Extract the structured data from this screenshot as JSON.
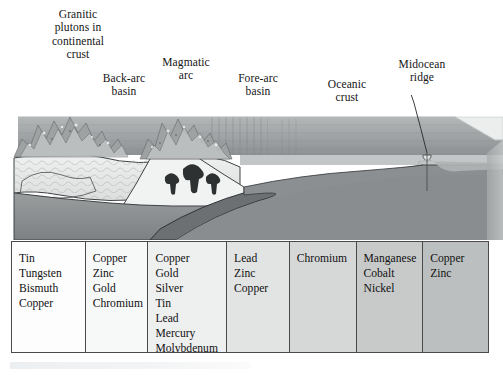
{
  "figure": {
    "type": "geologic-block-diagram"
  },
  "labels": [
    {
      "name": "granitic-plutons",
      "lines": [
        "Granitic",
        "plutons in",
        "continental",
        "crust"
      ]
    },
    {
      "name": "back-arc-basin",
      "lines": [
        "Back-arc",
        "basin"
      ]
    },
    {
      "name": "magmatic-arc",
      "lines": [
        "Magmatic",
        "arc"
      ]
    },
    {
      "name": "fore-arc-basin",
      "lines": [
        "Fore-arc",
        "basin"
      ]
    },
    {
      "name": "oceanic-crust",
      "lines": [
        "Oceanic",
        "crust"
      ]
    },
    {
      "name": "midocean-ridge",
      "lines": [
        "Midocean",
        "ridge"
      ]
    }
  ],
  "table": {
    "columns": [
      {
        "setting": "granitic-plutons",
        "shade": "#fdfdfd",
        "minerals": [
          "Tin",
          "Tungsten",
          "Bismuth",
          "Copper"
        ]
      },
      {
        "setting": "back-arc-basin",
        "shade": "#f7f8f8",
        "minerals": [
          "Copper",
          "Zinc",
          "Gold",
          "Chromium"
        ]
      },
      {
        "setting": "magmatic-arc",
        "shade": "#eeefef",
        "minerals": [
          "Copper",
          "Gold",
          "Silver",
          "Tin",
          "Lead",
          "Mercury",
          "Molybdenum"
        ]
      },
      {
        "setting": "fore-arc-basin",
        "shade": "#e2e3e3",
        "minerals": [
          "Lead",
          "Zinc",
          "Copper"
        ]
      },
      {
        "setting": "oceanic-crust",
        "shade": "#d6d7d7",
        "minerals": [
          "Chromium"
        ]
      },
      {
        "setting": "midocean-ridge-1",
        "shade": "#c8caca",
        "minerals": [
          "Manganese",
          "Cobalt",
          "Nickel"
        ]
      },
      {
        "setting": "midocean-ridge-2",
        "shade": "#bcbfbf",
        "minerals": [
          "Copper",
          "Zinc"
        ]
      }
    ]
  },
  "colors": {
    "ink": "#141414",
    "border": "#4a4a4a",
    "ocean_water": "#9a9d9e",
    "continental_crust": "#e9eaea",
    "mantle": "#8f9293",
    "magma": "#3a3c3d",
    "oceanic_crust": "#6f7273"
  }
}
